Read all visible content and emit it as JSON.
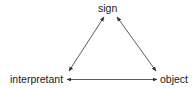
{
  "diagram": {
    "type": "semiotic-triangle",
    "nodes": [
      {
        "id": "sign",
        "label": "sign"
      },
      {
        "id": "interpretant",
        "label": "interpretant"
      },
      {
        "id": "object",
        "label": "object"
      }
    ],
    "edges": [
      {
        "from": "sign",
        "to": "interpretant",
        "direction": "bidirectional"
      },
      {
        "from": "sign",
        "to": "object",
        "direction": "bidirectional"
      },
      {
        "from": "interpretant",
        "to": "object",
        "direction": "bidirectional"
      }
    ],
    "colors": {
      "line": "#333333",
      "text": "#1a1a1a",
      "background": "#ffffff"
    }
  }
}
